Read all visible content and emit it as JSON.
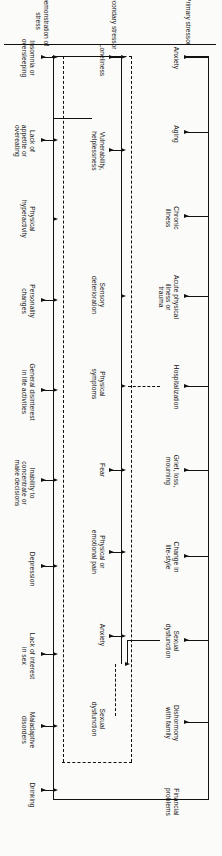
{
  "figure": {
    "orientation": "rotated-90-ccw",
    "colors": {
      "ink": "#111111",
      "paper": "#fbfbf9"
    }
  },
  "rows": [
    {
      "id": "primary",
      "label": "Primary stressor"
    },
    {
      "id": "secondary",
      "label": "Secondary stressor"
    },
    {
      "id": "demo",
      "label": "Demonstration of\nstress"
    }
  ],
  "primary_stressors": [
    {
      "label": "Anxiety"
    },
    {
      "label": "Aging"
    },
    {
      "label": "Chronic\nillness"
    },
    {
      "label": "Acute physical\nillness or\ntrauma"
    },
    {
      "label": "Hospitalization"
    },
    {
      "label": "Grief, loss,\nmourning"
    },
    {
      "label": "Change in\nlife-style"
    },
    {
      "label": "Sexual\ndysfunction"
    },
    {
      "label": "Dishormony\nwith family"
    },
    {
      "label": "Financial\nproblems"
    }
  ],
  "secondary_stressors": [
    {
      "label": "Loneliness"
    },
    {
      "label": "Vulnerability,\nhelplessness"
    },
    {
      "label": "Sensory\ndeterioration"
    },
    {
      "label": "Physical\nsymptoms"
    },
    {
      "label": "Fear"
    },
    {
      "label": "Physical or\nemotional pain"
    },
    {
      "label": "Anxiety"
    },
    {
      "label": "Sexual\ndysfunction"
    }
  ],
  "demonstrations_of_stress": [
    {
      "label": "Insomnia or\noversleeping"
    },
    {
      "label": "Lack of\nappetite or\novereating"
    },
    {
      "label": "Physical\nhyperactivity"
    },
    {
      "label": "Personality\nchanges"
    },
    {
      "label": "General disinterest\nin life activities"
    },
    {
      "label": "Inability to\nconcentrate or\nmake decisions"
    },
    {
      "label": "Depression"
    },
    {
      "label": "Lack of interest\nin sex"
    },
    {
      "label": "Maladaptive\ndisorders"
    },
    {
      "label": "Drinking"
    }
  ]
}
